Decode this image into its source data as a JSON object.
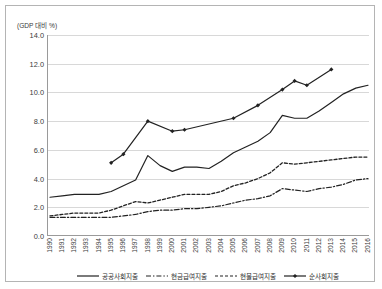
{
  "axis_unit_label": "(GDP 대비 %)",
  "chart_data": {
    "type": "line",
    "title": "",
    "xlabel": "",
    "ylabel": "(GDP 대비 %)",
    "ylim": [
      0.0,
      14.0
    ],
    "ytick_labels": [
      "0.0",
      "2.0",
      "4.0",
      "6.0",
      "8.0",
      "10.0",
      "12.0",
      "14.0"
    ],
    "ytick_values": [
      0.0,
      2.0,
      4.0,
      6.0,
      8.0,
      10.0,
      12.0,
      14.0
    ],
    "grid": true,
    "legend_position": "bottom",
    "categories": [
      "1990",
      "1991",
      "1992",
      "1993",
      "1994",
      "1995",
      "1996",
      "1997",
      "1998",
      "1999",
      "2000",
      "2001",
      "2002",
      "2003",
      "2004",
      "2005",
      "2006",
      "2007",
      "2008",
      "2009",
      "2010",
      "2011",
      "2012",
      "2013",
      "2014",
      "2015",
      "2016"
    ],
    "series": [
      {
        "name": "공공사회지출",
        "style": "solid",
        "color": "#222222",
        "values": [
          2.7,
          2.8,
          2.9,
          2.9,
          2.9,
          3.1,
          3.5,
          3.9,
          5.6,
          4.9,
          4.5,
          4.8,
          4.8,
          4.7,
          5.2,
          5.8,
          6.2,
          6.6,
          7.2,
          8.4,
          8.2,
          8.2,
          8.7,
          9.3,
          9.9,
          10.3,
          10.5
        ]
      },
      {
        "name": "현금급여지출",
        "style": "dash-dot",
        "color": "#222222",
        "values": [
          1.3,
          1.3,
          1.3,
          1.3,
          1.3,
          1.3,
          1.4,
          1.5,
          1.7,
          1.8,
          1.8,
          1.9,
          1.9,
          2.0,
          2.1,
          2.3,
          2.5,
          2.6,
          2.8,
          3.3,
          3.2,
          3.1,
          3.3,
          3.4,
          3.6,
          3.9,
          4.0
        ]
      },
      {
        "name": "현물급여지출",
        "style": "dotted",
        "color": "#222222",
        "values": [
          1.4,
          1.5,
          1.6,
          1.6,
          1.6,
          1.8,
          2.1,
          2.4,
          2.3,
          2.5,
          2.7,
          2.9,
          2.9,
          2.9,
          3.1,
          3.5,
          3.7,
          4.0,
          4.4,
          5.1,
          5.0,
          5.1,
          5.2,
          5.3,
          5.4,
          5.5,
          5.5
        ]
      },
      {
        "name": "순사회지출",
        "style": "solid-marker",
        "color": "#222222",
        "values": [
          null,
          null,
          null,
          null,
          null,
          5.1,
          5.7,
          null,
          8.0,
          null,
          7.3,
          7.4,
          null,
          null,
          null,
          8.2,
          null,
          9.1,
          null,
          10.2,
          10.8,
          10.5,
          null,
          11.6,
          null,
          null,
          null
        ]
      }
    ]
  },
  "legend": [
    {
      "label": "공공사회지출",
      "style": "solid"
    },
    {
      "label": "현금급여지출",
      "style": "dash-dot"
    },
    {
      "label": "현물급여지출",
      "style": "dotted"
    },
    {
      "label": "순사회지출",
      "style": "solid-marker"
    }
  ]
}
